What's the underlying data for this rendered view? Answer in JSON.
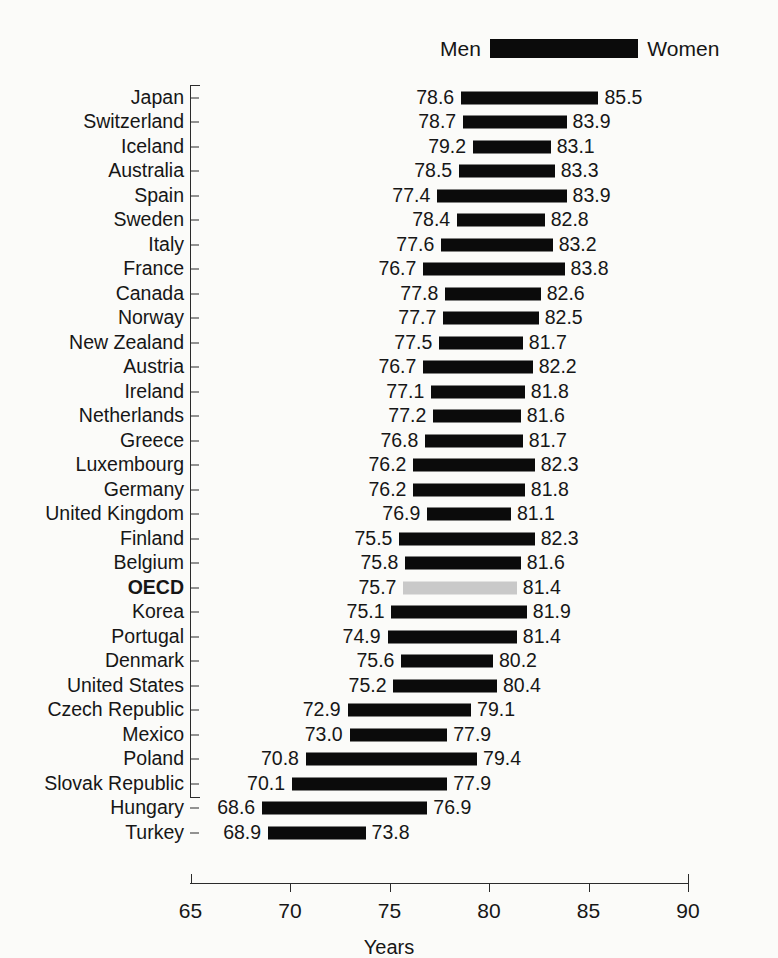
{
  "legend": {
    "left_label": "Men",
    "right_label": "Women",
    "bar_color": "#0b0b0b"
  },
  "axis": {
    "x_title": "Years",
    "x_ticks": [
      "65",
      "70",
      "75",
      "80",
      "85",
      "90"
    ],
    "x_min": 65,
    "x_max": 90
  },
  "highlight_row": "OECD",
  "highlight_color": "#c9c9c9",
  "chart_data": {
    "type": "bar",
    "title": "",
    "subtitle": "",
    "xlabel": "Years",
    "ylabel": "",
    "xlim": [
      65,
      90
    ],
    "grid": false,
    "legend_position": "top-right",
    "orientation": "horizontal",
    "bar_style": "range/dumbbell (men value to women value)",
    "categories": [
      "Japan",
      "Switzerland",
      "Iceland",
      "Australia",
      "Spain",
      "Sweden",
      "Italy",
      "France",
      "Canada",
      "Norway",
      "New Zealand",
      "Austria",
      "Ireland",
      "Netherlands",
      "Greece",
      "Luxembourg",
      "Germany",
      "United Kingdom",
      "Finland",
      "Belgium",
      "OECD",
      "Korea",
      "Portugal",
      "Denmark",
      "United States",
      "Czech Republic",
      "Mexico",
      "Poland",
      "Slovak Republic",
      "Hungary",
      "Turkey"
    ],
    "series": [
      {
        "name": "Men",
        "values": [
          78.6,
          78.7,
          79.2,
          78.5,
          77.4,
          78.4,
          77.6,
          76.7,
          77.8,
          77.7,
          77.5,
          76.7,
          77.1,
          77.2,
          76.8,
          76.2,
          76.2,
          76.9,
          75.5,
          75.8,
          75.7,
          75.1,
          74.9,
          75.6,
          75.2,
          72.9,
          73.0,
          70.8,
          70.1,
          68.6,
          68.9
        ]
      },
      {
        "name": "Women",
        "values": [
          85.5,
          83.9,
          83.1,
          83.3,
          83.9,
          82.8,
          83.2,
          83.8,
          82.6,
          82.5,
          81.7,
          82.2,
          81.8,
          81.6,
          81.7,
          82.3,
          81.8,
          81.1,
          82.3,
          81.6,
          81.4,
          81.9,
          81.4,
          80.2,
          80.4,
          79.1,
          77.9,
          79.4,
          77.9,
          76.9,
          73.8
        ]
      }
    ],
    "rows": [
      {
        "country": "Japan",
        "men": "78.6",
        "women": "85.5"
      },
      {
        "country": "Switzerland",
        "men": "78.7",
        "women": "83.9"
      },
      {
        "country": "Iceland",
        "men": "79.2",
        "women": "83.1"
      },
      {
        "country": "Australia",
        "men": "78.5",
        "women": "83.3"
      },
      {
        "country": "Spain",
        "men": "77.4",
        "women": "83.9"
      },
      {
        "country": "Sweden",
        "men": "78.4",
        "women": "82.8"
      },
      {
        "country": "Italy",
        "men": "77.6",
        "women": "83.2"
      },
      {
        "country": "France",
        "men": "76.7",
        "women": "83.8"
      },
      {
        "country": "Canada",
        "men": "77.8",
        "women": "82.6"
      },
      {
        "country": "Norway",
        "men": "77.7",
        "women": "82.5"
      },
      {
        "country": "New Zealand",
        "men": "77.5",
        "women": "81.7"
      },
      {
        "country": "Austria",
        "men": "76.7",
        "women": "82.2"
      },
      {
        "country": "Ireland",
        "men": "77.1",
        "women": "81.8"
      },
      {
        "country": "Netherlands",
        "men": "77.2",
        "women": "81.6"
      },
      {
        "country": "Greece",
        "men": "76.8",
        "women": "81.7"
      },
      {
        "country": "Luxembourg",
        "men": "76.2",
        "women": "82.3"
      },
      {
        "country": "Germany",
        "men": "76.2",
        "women": "81.8"
      },
      {
        "country": "United Kingdom",
        "men": "76.9",
        "women": "81.1"
      },
      {
        "country": "Finland",
        "men": "75.5",
        "women": "82.3"
      },
      {
        "country": "Belgium",
        "men": "75.8",
        "women": "81.6"
      },
      {
        "country": "OECD",
        "men": "75.7",
        "women": "81.4"
      },
      {
        "country": "Korea",
        "men": "75.1",
        "women": "81.9"
      },
      {
        "country": "Portugal",
        "men": "74.9",
        "women": "81.4"
      },
      {
        "country": "Denmark",
        "men": "75.6",
        "women": "80.2"
      },
      {
        "country": "United States",
        "men": "75.2",
        "women": "80.4"
      },
      {
        "country": "Czech Republic",
        "men": "72.9",
        "women": "79.1"
      },
      {
        "country": "Mexico",
        "men": "73.0",
        "women": "77.9"
      },
      {
        "country": "Poland",
        "men": "70.8",
        "women": "79.4"
      },
      {
        "country": "Slovak Republic",
        "men": "70.1",
        "women": "77.9"
      },
      {
        "country": "Hungary",
        "men": "68.6",
        "women": "76.9"
      },
      {
        "country": "Turkey",
        "men": "68.9",
        "women": "73.8"
      }
    ]
  }
}
